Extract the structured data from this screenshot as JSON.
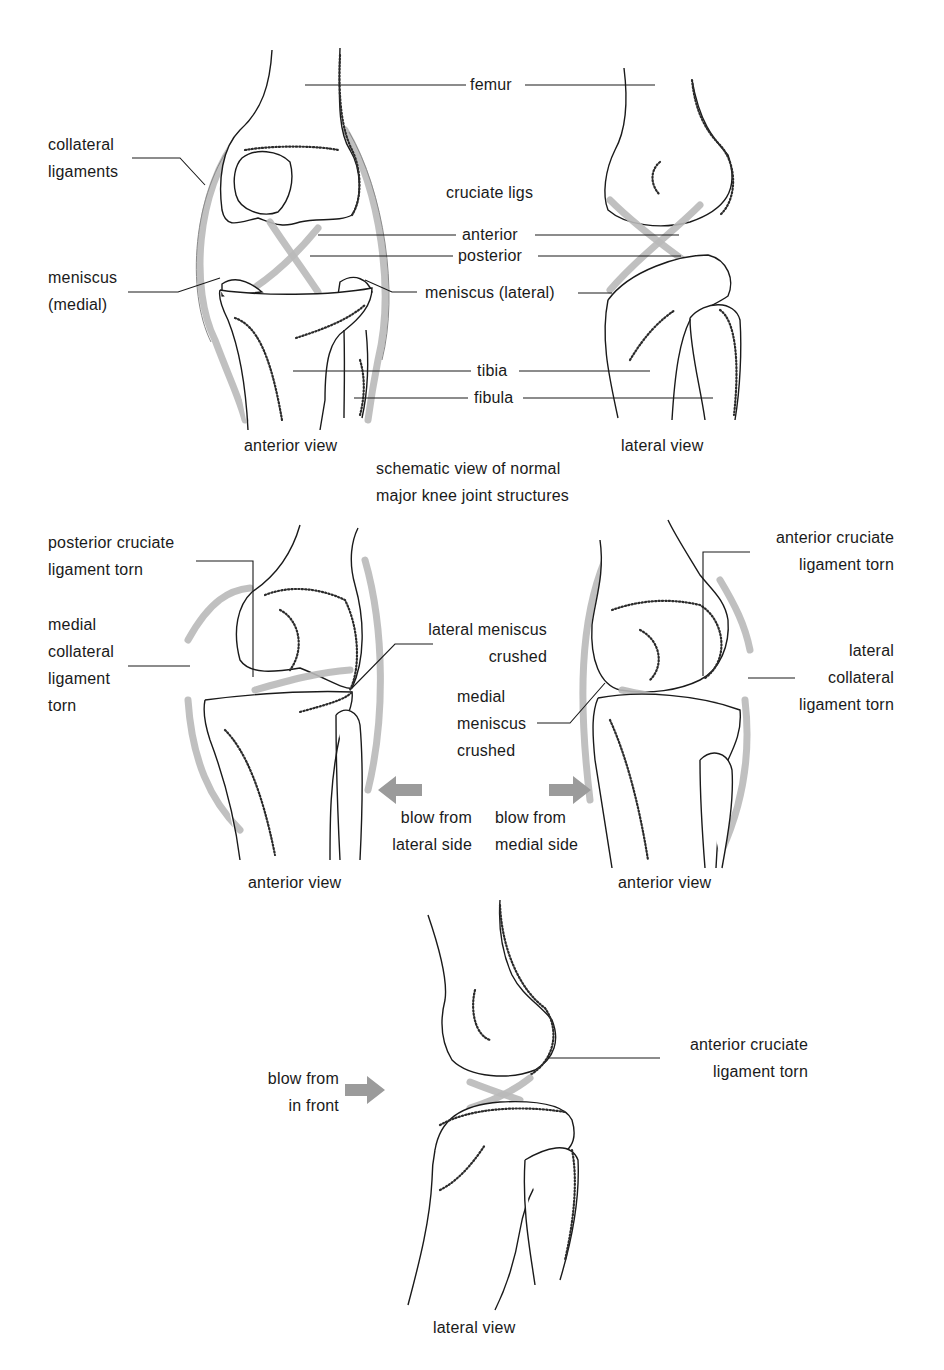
{
  "figure": {
    "top_section": {
      "caption_line1": "schematic view of normal",
      "caption_line2": "major knee joint structures",
      "anterior_view": {
        "view_label": "anterior view",
        "labels": {
          "collateral_ligaments": "collateral\nligaments",
          "meniscus_medial": "meniscus\n(medial)",
          "femur": "femur",
          "cruciate_ligs": "cruciate ligs",
          "anterior": "anterior",
          "posterior": "posterior",
          "meniscus_lateral": "meniscus (lateral)",
          "tibia": "tibia",
          "fibula": "fibula"
        }
      },
      "lateral_view": {
        "view_label": "lateral view"
      }
    },
    "middle_section": {
      "left_panel": {
        "view_label": "anterior view",
        "pcl_torn": "posterior cruciate\nligament torn",
        "mcl_torn": "medial\ncollateral\nligament\ntorn",
        "lateral_meniscus": "lateral meniscus\ncrushed",
        "blow": "blow from\nlateral side",
        "arrow_direction": "left"
      },
      "right_panel": {
        "view_label": "anterior view",
        "acl_torn": "anterior cruciate\nligament torn",
        "lcl_torn": "lateral\ncollateral\nligament torn",
        "medial_meniscus": "medial\nmeniscus\ncrushed",
        "blow": "blow from\nmedial side",
        "arrow_direction": "right"
      }
    },
    "bottom_section": {
      "view_label": "lateral view",
      "acl_torn": "anterior cruciate\nligament torn",
      "blow": "blow from\nin front",
      "arrow_direction": "right"
    },
    "colors": {
      "ink": "#1a1a1a",
      "ligament": "#b9b9b9",
      "arrow": "#9b9b9b",
      "background": "#ffffff"
    }
  }
}
